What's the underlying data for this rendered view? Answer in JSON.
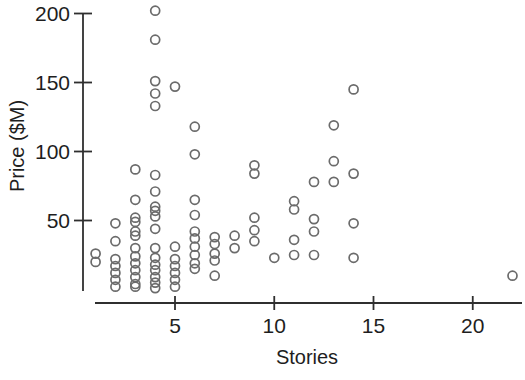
{
  "figure": {
    "background": "#ffffff",
    "marker_color": "#6b6b6b",
    "axis_color": "#2f2f2f",
    "text_color": "#1e1e1e"
  },
  "chart_data": {
    "type": "scatter",
    "title": "",
    "xlabel": "Stories",
    "ylabel": "Price ($M)",
    "x_ticks": [
      5,
      10,
      15,
      20
    ],
    "y_ticks": [
      50,
      100,
      150,
      200
    ],
    "xlim": [
      0,
      22.6
    ],
    "ylim": [
      -2,
      205
    ],
    "grid": false,
    "legend": null,
    "marker": "open-circle",
    "points": [
      [
        1,
        26
      ],
      [
        1,
        20
      ],
      [
        2,
        48
      ],
      [
        2,
        35
      ],
      [
        2,
        22
      ],
      [
        2,
        17
      ],
      [
        2,
        12
      ],
      [
        2,
        7
      ],
      [
        2,
        2
      ],
      [
        3,
        87
      ],
      [
        3,
        65
      ],
      [
        3,
        52
      ],
      [
        3,
        49
      ],
      [
        3,
        42
      ],
      [
        3,
        39
      ],
      [
        3,
        30
      ],
      [
        3,
        24
      ],
      [
        3,
        19
      ],
      [
        3,
        14
      ],
      [
        3,
        9
      ],
      [
        3,
        4
      ],
      [
        3,
        2
      ],
      [
        4,
        202
      ],
      [
        4,
        181
      ],
      [
        4,
        151
      ],
      [
        4,
        142
      ],
      [
        4,
        133
      ],
      [
        4,
        83
      ],
      [
        4,
        71
      ],
      [
        4,
        60
      ],
      [
        4,
        57
      ],
      [
        4,
        53
      ],
      [
        4,
        44
      ],
      [
        4,
        30
      ],
      [
        4,
        23
      ],
      [
        4,
        18
      ],
      [
        4,
        14
      ],
      [
        4,
        9
      ],
      [
        4,
        5
      ],
      [
        4,
        1
      ],
      [
        5,
        147
      ],
      [
        5,
        31
      ],
      [
        5,
        22
      ],
      [
        5,
        17
      ],
      [
        5,
        12
      ],
      [
        5,
        7
      ],
      [
        5,
        2
      ],
      [
        6,
        118
      ],
      [
        6,
        98
      ],
      [
        6,
        65
      ],
      [
        6,
        54
      ],
      [
        6,
        42
      ],
      [
        6,
        37
      ],
      [
        6,
        31
      ],
      [
        6,
        25
      ],
      [
        6,
        19
      ],
      [
        6,
        15
      ],
      [
        7,
        38
      ],
      [
        7,
        33
      ],
      [
        7,
        26
      ],
      [
        7,
        21
      ],
      [
        7,
        10
      ],
      [
        8,
        39
      ],
      [
        8,
        30
      ],
      [
        9,
        90
      ],
      [
        9,
        84
      ],
      [
        9,
        52
      ],
      [
        9,
        43
      ],
      [
        9,
        35
      ],
      [
        10,
        23
      ],
      [
        11,
        64
      ],
      [
        11,
        58
      ],
      [
        11,
        36
      ],
      [
        11,
        25
      ],
      [
        12,
        78
      ],
      [
        12,
        51
      ],
      [
        12,
        42
      ],
      [
        12,
        25
      ],
      [
        13,
        119
      ],
      [
        13,
        93
      ],
      [
        13,
        78
      ],
      [
        14,
        145
      ],
      [
        14,
        84
      ],
      [
        14,
        48
      ],
      [
        14,
        23
      ],
      [
        22,
        10
      ]
    ]
  }
}
